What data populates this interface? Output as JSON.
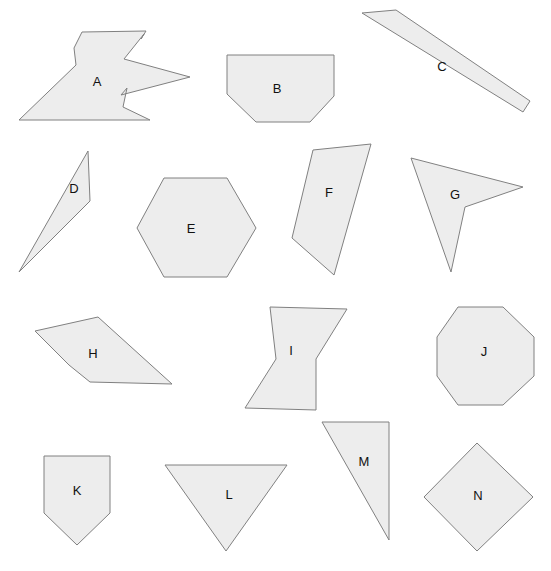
{
  "canvas": {
    "width": 551,
    "height": 571,
    "background": "#ffffff",
    "title": "Polygon Shapes Worksheet"
  },
  "style": {
    "fill": "#ededed",
    "stroke": "#808080",
    "stroke_width": 1,
    "label_color": "#111111",
    "label_font_size": 13
  },
  "chart_data": {
    "type": "diagram",
    "shape_count": 14,
    "rows": 4,
    "labels": [
      "A",
      "B",
      "C",
      "D",
      "E",
      "F",
      "G",
      "H",
      "I",
      "J",
      "K",
      "L",
      "M",
      "N"
    ]
  },
  "shapes": [
    {
      "id": "shape-a",
      "label": "A",
      "kind": "concave-zigzag-polygon",
      "row": 1,
      "vertices": "82,32 146,31 141,39 144,34 124,59 190,77 121,95 127,88 123,107 150,120 19,120 76,65 74,48",
      "label_x": 97,
      "label_y": 83
    },
    {
      "id": "shape-b",
      "label": "B",
      "kind": "hexagonal-trapezoid",
      "row": 1,
      "vertices": "227,55 334,55 334,96 310,122 256,122 227,94",
      "label_x": 277,
      "label_y": 90
    },
    {
      "id": "shape-c",
      "label": "C",
      "kind": "rotated-rectangle-bar",
      "row": 1,
      "vertices": "362,13 396,10 530,101 523,112",
      "label_x": 442,
      "label_y": 68
    },
    {
      "id": "shape-d",
      "label": "D",
      "kind": "sliver-triangle",
      "row": 2,
      "vertices": "88,151 90,201 19,272",
      "label_x": 74,
      "label_y": 190
    },
    {
      "id": "shape-e",
      "label": "E",
      "kind": "regular-hexagon",
      "row": 2,
      "vertices": "164,178 227,178 256,228 227,277 164,277 137,228",
      "label_x": 191,
      "label_y": 230
    },
    {
      "id": "shape-f",
      "label": "F",
      "kind": "quadrilateral",
      "row": 2,
      "vertices": "313,150 371,144 334,275 292,238",
      "label_x": 329,
      "label_y": 194
    },
    {
      "id": "shape-g",
      "label": "G",
      "kind": "concave-dart-arrow",
      "row": 2,
      "vertices": "411,158 523,187 465,207 451,272",
      "label_x": 455,
      "label_y": 196
    },
    {
      "id": "shape-h",
      "label": "H",
      "kind": "concave-arrow-polygon",
      "row": 3,
      "vertices": "35,331 98,317 172,384 90,382 69,365",
      "label_x": 93,
      "label_y": 355
    },
    {
      "id": "shape-i",
      "label": "I",
      "kind": "hourglass-bowtie",
      "row": 3,
      "vertices": "270,307 347,309 316,359 316,410 245,408 276,359",
      "label_x": 291,
      "label_y": 352
    },
    {
      "id": "shape-j",
      "label": "J",
      "kind": "octagon",
      "row": 3,
      "vertices": "458,307 503,307 534,337 534,376 503,405 458,405 437,376 437,337",
      "label_x": 484,
      "label_y": 353
    },
    {
      "id": "shape-k",
      "label": "K",
      "kind": "pentagon-home-plate",
      "row": 4,
      "vertices": "44,456 110,456 110,513 77,545 44,513",
      "label_x": 77,
      "label_y": 492
    },
    {
      "id": "shape-l",
      "label": "L",
      "kind": "triangle-down",
      "row": 4,
      "vertices": "165,465 287,465 226,551",
      "label_x": 229,
      "label_y": 496
    },
    {
      "id": "shape-m",
      "label": "M",
      "kind": "right-triangle",
      "row": 4,
      "vertices": "389,422 389,540 322,422",
      "label_x": 364,
      "label_y": 463
    },
    {
      "id": "shape-n",
      "label": "N",
      "kind": "diamond-rotated-square",
      "row": 4,
      "vertices": "477,443 533,497 477,551 424,497",
      "label_x": 478,
      "label_y": 497
    }
  ]
}
